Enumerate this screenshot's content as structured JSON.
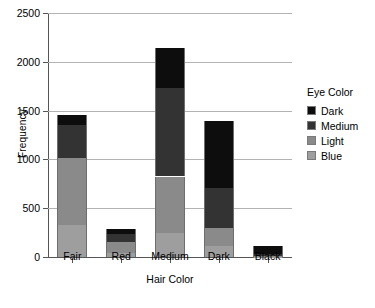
{
  "chart_data": {
    "type": "bar",
    "subtype": "stacked-bar",
    "title": "",
    "xlabel": "Hair Color",
    "ylabel": "Frequency",
    "categories": [
      "Fair",
      "Red",
      "Medium",
      "Dark",
      "Black"
    ],
    "ylim": [
      0,
      2500
    ],
    "yticks": [
      0,
      500,
      1000,
      1500,
      2000,
      2500
    ],
    "ytick_labels": [
      "0",
      "500",
      "1000",
      "1500",
      "2000",
      "2500"
    ],
    "grid": true,
    "legend_title": "Eye Color",
    "legend_position": "right",
    "stack_order_bottom_to_top": [
      "Blue",
      "Light",
      "Medium",
      "Dark"
    ],
    "series": [
      {
        "name": "Blue",
        "color": "#9e9e9e",
        "values": [
          326,
          38,
          241,
          110,
          3
        ]
      },
      {
        "name": "Light",
        "color": "#8a8a8a",
        "values": [
          688,
          116,
          584,
          188,
          4
        ]
      },
      {
        "name": "Medium",
        "color": "#333333",
        "values": [
          343,
          84,
          909,
          412,
          26
        ]
      },
      {
        "name": "Dark",
        "color": "#0d0d0d",
        "values": [
          98,
          48,
          403,
          681,
          85
        ]
      }
    ],
    "totals": [
      1455,
      286,
      2137,
      1391,
      118
    ]
  },
  "legend": {
    "title": "Eye Color",
    "entries": [
      {
        "label": "Dark",
        "color": "#0d0d0d"
      },
      {
        "label": "Medium",
        "color": "#333333"
      },
      {
        "label": "Light",
        "color": "#8a8a8a"
      },
      {
        "label": "Blue",
        "color": "#9e9e9e"
      }
    ]
  },
  "axes": {
    "y_title": "Frequency",
    "x_title": "Hair Color"
  }
}
